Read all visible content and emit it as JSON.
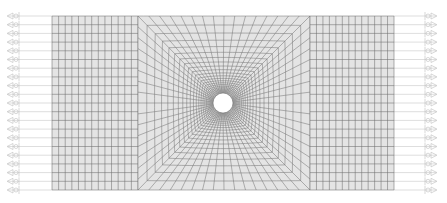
{
  "diagram": {
    "title": "Structured mesh around a circular cylinder",
    "type": "fem-mesh",
    "colors": {
      "background": "#ffffff",
      "mesh_fill": "#e4e4e4",
      "mesh_line": "#6e6e6e",
      "hole_fill": "#ffffff",
      "bc_line": "#c8c8c8",
      "bc_symbol": "#bdbdbd"
    },
    "domain": {
      "x0": 52,
      "y0": 16,
      "x1": 394,
      "y1": 190
    },
    "blocks": [
      {
        "name": "left-block",
        "kind": "rect",
        "x0": 52,
        "x1": 138,
        "cols": 13,
        "rows": 20
      },
      {
        "name": "center-block",
        "kind": "o-grid",
        "x0": 138,
        "x1": 310,
        "radial_divisions": 64,
        "ring_count": 22
      },
      {
        "name": "right-block",
        "kind": "rect",
        "x0": 310,
        "x1": 394,
        "cols": 13,
        "rows": 20
      }
    ],
    "hole": {
      "cx": 223,
      "cy": 103,
      "r": 10
    },
    "boundary_conditions": {
      "left": {
        "symbol_x": 14,
        "count": 20,
        "direction": "left"
      },
      "right": {
        "symbol_x": 430,
        "count": 20,
        "direction": "right"
      }
    }
  }
}
